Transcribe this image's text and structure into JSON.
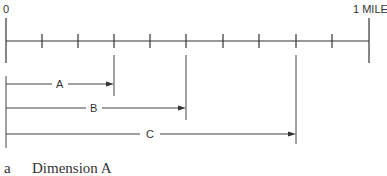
{
  "diagram": {
    "scale": {
      "start_label": "0",
      "end_label": "1 MILE",
      "divisions": 10
    },
    "dimensions": [
      {
        "label": "A",
        "fraction": 0.3
      },
      {
        "label": "B",
        "fraction": 0.5
      },
      {
        "label": "C",
        "fraction": 0.8
      }
    ],
    "caption": {
      "letter": "a",
      "text": "Dimension A"
    }
  }
}
